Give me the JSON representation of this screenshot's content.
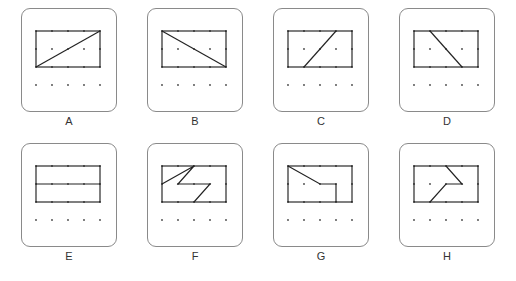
{
  "worksheet": {
    "title": "Shapes on dot grids",
    "panel_count": 8,
    "rows": 2,
    "columns": 4,
    "background_color": "#ffffff",
    "card_border_color": "#8a8a8a",
    "ink_color": "#222222",
    "dot_color": "#444444",
    "label_color": "#333333"
  },
  "grid": {
    "dot_columns": 5,
    "dot_rows": 4,
    "x_positions": [
      14,
      30,
      46,
      62,
      78
    ],
    "y_positions": [
      22,
      40,
      58,
      76
    ],
    "description": "5 by 4 array of dots in each card"
  },
  "panels": [
    {
      "label": "A",
      "figure": "rectangle-with-diagonal-bottom-left-to-top-right",
      "rect": {
        "x": 14,
        "y": 22,
        "width": 64,
        "height": 36
      },
      "lines": [
        {
          "points": "14,58 78,22",
          "description": "diagonal from bottom-left corner to top-right corner"
        }
      ]
    },
    {
      "label": "B",
      "figure": "rectangle-with-diagonal-top-left-to-bottom-right",
      "rect": {
        "x": 14,
        "y": 22,
        "width": 64,
        "height": 36
      },
      "lines": [
        {
          "points": "14,22 78,58",
          "description": "diagonal from top-left corner to bottom-right corner"
        }
      ]
    },
    {
      "label": "C",
      "figure": "rectangle-with-short-diagonal-to-top-right",
      "rect": {
        "x": 14,
        "y": 22,
        "width": 64,
        "height": 36
      },
      "lines": [
        {
          "points": "30,58 62,22",
          "description": "diagonal from bottom edge to top edge, rising right"
        }
      ]
    },
    {
      "label": "D",
      "figure": "rectangle-with-short-diagonal-falling-right",
      "rect": {
        "x": 14,
        "y": 22,
        "width": 64,
        "height": 36
      },
      "lines": [
        {
          "points": "30,22 62,58",
          "description": "diagonal from top edge down to bottom edge, falling right"
        }
      ]
    },
    {
      "label": "E",
      "figure": "rectangle-split-by-horizontal-line",
      "rect": {
        "x": 14,
        "y": 22,
        "width": 64,
        "height": 36
      },
      "lines": [
        {
          "points": "14,40 78,40",
          "description": "horizontal line across the middle of the rectangle"
        }
      ]
    },
    {
      "label": "F",
      "figure": "zigzag-z-shape",
      "rect": {
        "x": 14,
        "y": 22,
        "width": 64,
        "height": 36
      },
      "lines": [
        {
          "points": "14,40 46,22 30,40 62,40 46,58",
          "description": "zigzag Z shape inside the rectangle"
        }
      ]
    },
    {
      "label": "G",
      "figure": "notched-step-shape",
      "rect": {
        "x": 14,
        "y": 22,
        "width": 64,
        "height": 36
      },
      "lines": [
        {
          "points": "14,22 46,40 62,40 62,58",
          "description": "slope down from top-left, then right, then down to bottom edge"
        }
      ]
    },
    {
      "label": "H",
      "figure": "chevron-pointing-right",
      "rect": {
        "x": 14,
        "y": 22,
        "width": 64,
        "height": 36
      },
      "lines": [
        {
          "points": "46,22 62,40 46,40 30,58",
          "description": "chevron arrow bending at the right-middle dot"
        }
      ]
    }
  ]
}
